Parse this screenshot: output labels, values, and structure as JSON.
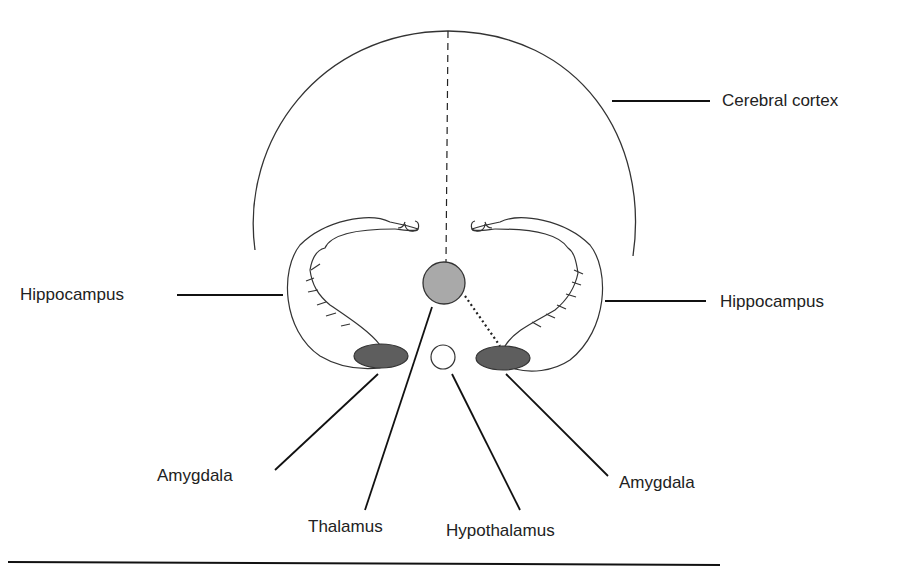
{
  "labels": {
    "cerebral_cortex": "Cerebral cortex",
    "hippocampus_left": "Hippocampus",
    "hippocampus_right": "Hippocampus",
    "amygdala_left": "Amygdala",
    "amygdala_right": "Amygdala",
    "thalamus": "Thalamus",
    "hypothalamus": "Hypothalamus"
  },
  "colors": {
    "line": "#1a1a1a",
    "outline": "#333333",
    "thalamus_fill": "#a9a9a9",
    "amygdala_fill": "#5e5e5e",
    "hypothalamus_fill": "#ffffff",
    "text": "#222222"
  }
}
